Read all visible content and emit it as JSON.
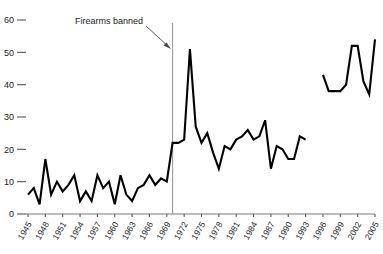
{
  "chart_data": {
    "type": "line",
    "title": "",
    "subtitle": "",
    "xlabel": "",
    "ylabel": "",
    "xlim": [
      1945,
      2005
    ],
    "ylim": [
      0,
      60
    ],
    "grid": false,
    "legend": "none",
    "series_name": "Homicides",
    "line_color": "#000000",
    "x": [
      1945,
      1946,
      1947,
      1948,
      1949,
      1950,
      1951,
      1952,
      1953,
      1954,
      1955,
      1956,
      1957,
      1958,
      1959,
      1960,
      1961,
      1962,
      1963,
      1964,
      1965,
      1966,
      1967,
      1968,
      1969,
      1970,
      1971,
      1972,
      1973,
      1974,
      1975,
      1976,
      1977,
      1978,
      1979,
      1980,
      1981,
      1982,
      1983,
      1984,
      1985,
      1986,
      1987,
      1988,
      1989,
      1990,
      1991,
      1992,
      1993,
      1996,
      1997,
      1998,
      1999,
      2000,
      2001,
      2002,
      2003,
      2004,
      2005
    ],
    "y": [
      6,
      8,
      3,
      17,
      6,
      10,
      7,
      9,
      12,
      4,
      7,
      4,
      12,
      8,
      10,
      3,
      12,
      6,
      4,
      8,
      9,
      12,
      9,
      11,
      10,
      22,
      22,
      23,
      51,
      27,
      22,
      25,
      19,
      14,
      21,
      20,
      23,
      24,
      26,
      23,
      24,
      29,
      14,
      21,
      20,
      17,
      17,
      24,
      23,
      43,
      38,
      38,
      38,
      40,
      52,
      52,
      41,
      37,
      54
    ],
    "x_ticks": [
      1945,
      1948,
      1951,
      1954,
      1957,
      1960,
      1963,
      1966,
      1969,
      1972,
      1975,
      1978,
      1981,
      1984,
      1987,
      1990,
      1993,
      1996,
      1999,
      2002,
      2005
    ],
    "x_tick_labels": [
      "1945",
      "1948",
      "1951",
      "1954",
      "1957",
      "1960",
      "1963",
      "1966",
      "1969",
      "1972",
      "1975",
      "1978",
      "1981",
      "1984",
      "1987",
      "1990",
      "1993",
      "1996",
      "1999",
      "2002",
      "2005"
    ],
    "y_ticks": [
      0,
      10,
      20,
      30,
      40,
      50,
      60
    ],
    "y_tick_labels": [
      "0",
      "10",
      "20",
      "30",
      "40",
      "50",
      "60"
    ],
    "gap_after_year": 1993,
    "annotations": [
      {
        "text": "Firearms banned",
        "event_year": 1970,
        "marker": "vertical-line",
        "arrow": true
      }
    ]
  }
}
